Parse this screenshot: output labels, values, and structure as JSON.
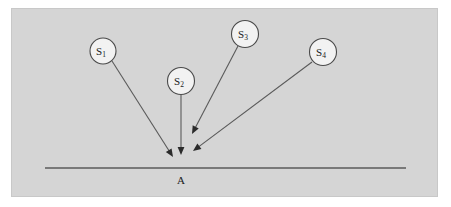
{
  "figure": {
    "type": "ray-convergence-diagram",
    "background_color": "#ffffff",
    "panel_color": "#d5d5d5",
    "panel_border_color": "#c8c8c8",
    "line_color": "#5a5a5a",
    "arrow_color": "#2b2b2b",
    "source_fill_color": "#f2f2f2",
    "source_stroke_color": "#4a4a4a",
    "text_color": "#1a1a1a",
    "panel": {
      "x": 11,
      "y": 8,
      "width": 426,
      "height": 188
    }
  },
  "surface": {
    "label": "A",
    "label_x": 181,
    "label_y": 180,
    "x1": 45,
    "x2": 406,
    "y": 168
  },
  "sources": [
    {
      "id": "s1",
      "symbol": "S",
      "subscript": "1",
      "cx": 103,
      "cy": 51,
      "r": 13,
      "ray": {
        "x1": 112,
        "y1": 61,
        "x2": 173,
        "y2": 157
      }
    },
    {
      "id": "s2",
      "symbol": "S",
      "subscript": "2",
      "cx": 181,
      "cy": 81,
      "r": 13.5,
      "ray": {
        "x1": 181,
        "y1": 95,
        "x2": 181,
        "y2": 155
      }
    },
    {
      "id": "s3",
      "symbol": "S",
      "subscript": "3",
      "cx": 245,
      "cy": 34,
      "r": 13.5,
      "ray": {
        "x1": 238,
        "y1": 46,
        "x2": 192,
        "y2": 134
      }
    },
    {
      "id": "s4",
      "symbol": "S",
      "subscript": "4",
      "cx": 323,
      "cy": 52,
      "r": 13.5,
      "ray": {
        "x1": 312,
        "y1": 62,
        "x2": 193,
        "y2": 151
      }
    }
  ]
}
